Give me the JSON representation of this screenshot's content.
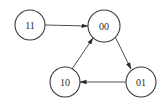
{
  "diagram": {
    "type": "state-transition",
    "nodes": [
      {
        "id": "11",
        "label": "11",
        "cx": 30,
        "cy": 25,
        "r": 15
      },
      {
        "id": "00",
        "label": "00",
        "cx": 104,
        "cy": 26,
        "r": 16
      },
      {
        "id": "10",
        "label": "10",
        "cx": 65,
        "cy": 82,
        "r": 15
      },
      {
        "id": "01",
        "label": "01",
        "cx": 141,
        "cy": 82,
        "r": 15
      }
    ],
    "edges": [
      {
        "from": "11",
        "to": "00"
      },
      {
        "from": "00",
        "to": "01"
      },
      {
        "from": "01",
        "to": "10"
      },
      {
        "from": "10",
        "to": "00"
      }
    ]
  }
}
